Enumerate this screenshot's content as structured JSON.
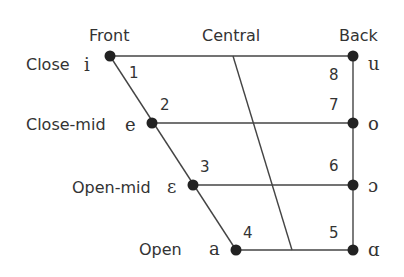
{
  "diagram": {
    "type": "vowel-quadrilateral",
    "column_headers": [
      {
        "id": "front",
        "label": "Front"
      },
      {
        "id": "central",
        "label": "Central"
      },
      {
        "id": "back",
        "label": "Back"
      }
    ],
    "row_labels": [
      {
        "id": "close",
        "label": "Close"
      },
      {
        "id": "close-mid",
        "label": "Close-mid"
      },
      {
        "id": "open-mid",
        "label": "Open-mid"
      },
      {
        "id": "open",
        "label": "Open"
      }
    ],
    "vowels": [
      {
        "number": "1",
        "symbol": "i",
        "position": "front-close"
      },
      {
        "number": "2",
        "symbol": "e",
        "position": "front-close-mid"
      },
      {
        "number": "3",
        "symbol": "ε",
        "position": "front-open-mid"
      },
      {
        "number": "4",
        "symbol": "a",
        "position": "front-open"
      },
      {
        "number": "5",
        "symbol": "ɑ",
        "position": "back-open"
      },
      {
        "number": "6",
        "symbol": "ɔ",
        "position": "back-open-mid"
      },
      {
        "number": "7",
        "symbol": "o",
        "position": "back-close-mid"
      },
      {
        "number": "8",
        "symbol": "u",
        "position": "back-close"
      }
    ]
  }
}
